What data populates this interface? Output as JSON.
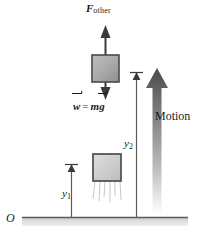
{
  "figure": {
    "background_color": "#ffffff",
    "width": 201,
    "height": 242
  },
  "labels": {
    "force_symbol": "F",
    "force_subscript": "other",
    "weight_symbol": "w",
    "weight_equals": "=",
    "weight_mass": "m",
    "weight_gravity": "g",
    "motion": "Motion",
    "y2_symbol": "y",
    "y2_subscript": "2",
    "y1_symbol": "y",
    "y1_subscript": "1",
    "origin": "O"
  },
  "colors": {
    "stroke": "#3a3a3a",
    "ink": "#1a1a1a",
    "block_upper_fill": "#a9a9a9",
    "block_upper_border": "#4a4a4a",
    "block_lower_fill": "#cccccc",
    "block_lower_border": "#555555",
    "ground_line": "#5a5a5a",
    "ground_band": "#d6d6d6",
    "motion_arrow_top": "#4d4d4d",
    "motion_arrow_bottom": "#ffffff",
    "blur_line": "#b8b8b8"
  },
  "elements": {
    "force_arrow_up": "upward force vector arrow",
    "weight_arrow_down": "downward weight vector arrow",
    "block_upper": "block in flight",
    "block_lower": "block at launch position",
    "motion_arrow": "large shaded motion direction arrow",
    "height_line_y1": "initial height measurement line",
    "height_line_y2": "final height measurement line",
    "ground": "ground reference line",
    "blur_lines": "motion blur streaks under lower block"
  }
}
